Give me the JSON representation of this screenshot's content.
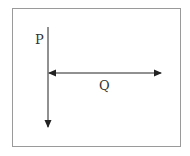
{
  "diagram": {
    "labels": {
      "p": "P",
      "q": "Q"
    },
    "colors": {
      "border": "#9a9a9a",
      "arrow": "#222222",
      "text": "#333333"
    },
    "vectors": [
      {
        "name": "P",
        "direction": "down"
      },
      {
        "name": "Q",
        "direction": "bidirectional-horizontal"
      }
    ]
  }
}
